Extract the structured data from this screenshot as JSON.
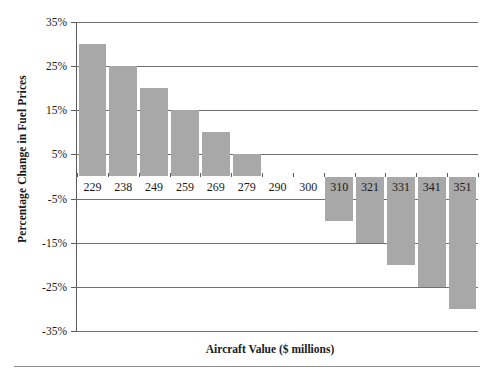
{
  "chart_data": {
    "type": "bar",
    "title": "",
    "xlabel": "Aircraft Value ($ millions)",
    "ylabel": "Percentage Change in Fuel Prices",
    "categories": [
      "229",
      "238",
      "249",
      "259",
      "269",
      "279",
      "290",
      "300",
      "310",
      "321",
      "331",
      "341",
      "351"
    ],
    "values": [
      30,
      25,
      20,
      15,
      10,
      5,
      0,
      0,
      -10,
      -15,
      -20,
      -25,
      -30
    ],
    "ylim": [
      -35,
      35
    ],
    "ytick_values": [
      35,
      25,
      15,
      5,
      -5,
      -15,
      -25,
      -35
    ],
    "ytick_labels": [
      "35%",
      "25%",
      "15%",
      "5%",
      "-5%",
      "-15%",
      "-25%",
      "-35%"
    ],
    "grid": true,
    "legend": "none",
    "bar_color": "#a8a8a8",
    "axis_color": "#5b5b5b",
    "gridline_color": "#6f6f6f"
  }
}
